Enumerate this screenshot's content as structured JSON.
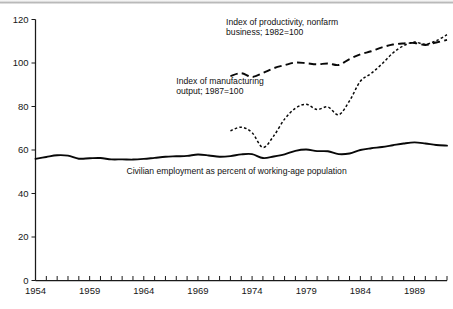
{
  "chart_data": {
    "type": "line",
    "title": "",
    "xlabel": "",
    "ylabel": "",
    "xlim": [
      1954,
      1992
    ],
    "ylim": [
      0,
      120
    ],
    "grid": false,
    "legend_position": "inline-annotations",
    "y_ticks": [
      0,
      20,
      40,
      60,
      80,
      100,
      120
    ],
    "x_ticks_labeled": [
      1954,
      1959,
      1964,
      1969,
      1974,
      1979,
      1984,
      1989
    ],
    "x_tick_step_minor": 1,
    "annotations": [
      {
        "id": "productivity-label",
        "lines": [
          "Index of productivity, nonfarm",
          "business; 1982=100"
        ],
        "x": 1971.6,
        "y": 117.5
      },
      {
        "id": "manufacturing-label",
        "lines": [
          "Index of manufacturing",
          "output; 1987=100"
        ],
        "x": 1967.0,
        "y": 90.5
      },
      {
        "id": "employment-label",
        "lines": [
          "Civilian employment as percent of working-age population"
        ],
        "x": 1962.4,
        "y": 49.0
      }
    ],
    "series": [
      {
        "name": "Index of productivity, nonfarm business; 1982=100",
        "style": "dashed-long",
        "x": [
          1972,
          1973,
          1974,
          1975,
          1976,
          1977,
          1978,
          1979,
          1980,
          1981,
          1982,
          1983,
          1984,
          1985,
          1986,
          1987,
          1988,
          1989,
          1990,
          1991,
          1992
        ],
        "values": [
          94.0,
          95.3,
          93.6,
          95.4,
          97.6,
          99.0,
          100.2,
          99.9,
          99.4,
          99.8,
          99.1,
          101.8,
          104.0,
          105.4,
          107.2,
          108.5,
          109.0,
          109.2,
          108.3,
          109.4,
          110.6
        ]
      },
      {
        "name": "Index of manufacturing output; 1987=100",
        "style": "dotted-short",
        "x": [
          1972,
          1973,
          1974,
          1975,
          1976,
          1977,
          1978,
          1979,
          1980,
          1981,
          1982,
          1983,
          1984,
          1985,
          1986,
          1987,
          1988,
          1989,
          1990,
          1991,
          1992
        ],
        "values": [
          68.8,
          70.5,
          68.0,
          61.2,
          66.5,
          74.2,
          79.2,
          81.0,
          78.6,
          79.8,
          76.2,
          82.6,
          91.6,
          95.2,
          99.6,
          104.6,
          108.0,
          109.6,
          108.6,
          110.2,
          113.0
        ]
      },
      {
        "name": "Civilian employment as percent of working-age population",
        "style": "solid",
        "x": [
          1954,
          1955,
          1956,
          1957,
          1958,
          1959,
          1960,
          1961,
          1962,
          1963,
          1964,
          1965,
          1966,
          1967,
          1968,
          1969,
          1970,
          1971,
          1972,
          1973,
          1974,
          1975,
          1976,
          1977,
          1978,
          1979,
          1980,
          1981,
          1982,
          1983,
          1984,
          1985,
          1986,
          1987,
          1988,
          1989,
          1990,
          1991,
          1992
        ],
        "values": [
          55.9,
          56.8,
          57.6,
          57.4,
          56.0,
          56.2,
          56.3,
          55.7,
          55.7,
          55.6,
          55.9,
          56.4,
          56.9,
          57.1,
          57.3,
          57.9,
          57.5,
          56.9,
          57.2,
          58.0,
          58.1,
          56.3,
          57.0,
          58.0,
          59.6,
          60.2,
          59.5,
          59.4,
          58.1,
          58.4,
          60.0,
          60.8,
          61.4,
          62.2,
          63.0,
          63.5,
          63.0,
          62.3,
          62.0
        ]
      }
    ]
  }
}
